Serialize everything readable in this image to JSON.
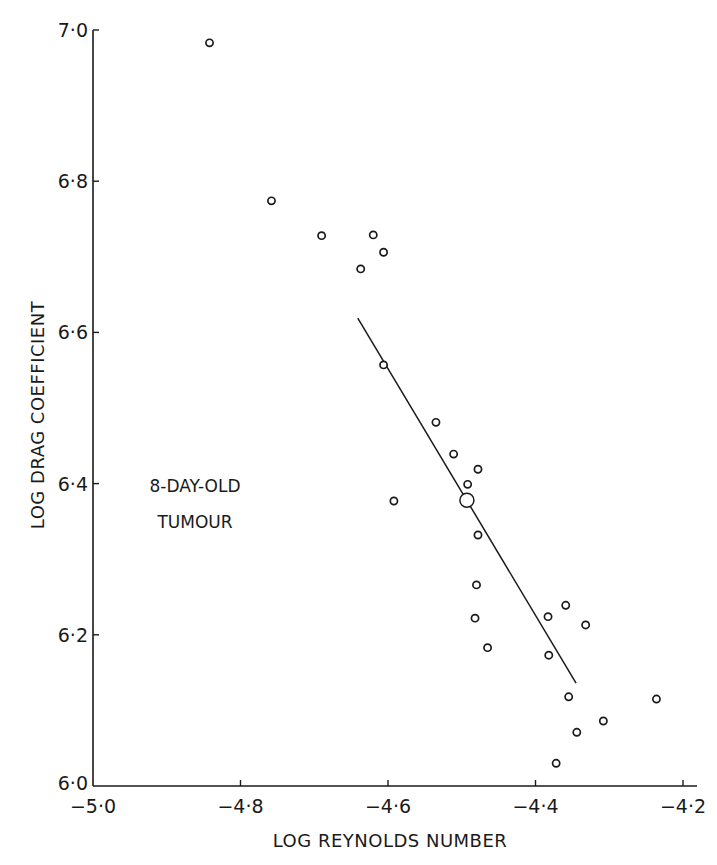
{
  "chart_data": {
    "type": "scatter",
    "title": "",
    "xlabel": "LOG REYNOLDS NUMBER",
    "ylabel": "LOG DRAG COEFFICIENT",
    "xlim": [
      -5.0,
      -4.2
    ],
    "ylim": [
      6.0,
      7.0
    ],
    "x_ticks": [
      -5.0,
      -4.8,
      -4.6,
      -4.4,
      -4.2
    ],
    "x_tick_labels": [
      "−5·0",
      "−4·8",
      "−4·6",
      "−4·4",
      "−4·2"
    ],
    "y_ticks": [
      6.0,
      6.2,
      6.4,
      6.6,
      6.8,
      7.0
    ],
    "y_tick_labels": [
      "6·0",
      "6·2",
      "6·4",
      "6·6",
      "6·8",
      "7·0"
    ],
    "grid": false,
    "legend": null,
    "annotation": [
      "8-DAY-OLD",
      "TUMOUR"
    ],
    "series": [
      {
        "name": "observations",
        "marker": "open-circle",
        "points": [
          {
            "x": -4.842,
            "y": 6.983
          },
          {
            "x": -4.758,
            "y": 6.774
          },
          {
            "x": -4.69,
            "y": 6.728
          },
          {
            "x": -4.62,
            "y": 6.729
          },
          {
            "x": -4.606,
            "y": 6.706
          },
          {
            "x": -4.637,
            "y": 6.684
          },
          {
            "x": -4.606,
            "y": 6.557
          },
          {
            "x": -4.535,
            "y": 6.481
          },
          {
            "x": -4.511,
            "y": 6.439
          },
          {
            "x": -4.478,
            "y": 6.419
          },
          {
            "x": -4.492,
            "y": 6.399
          },
          {
            "x": -4.592,
            "y": 6.377
          },
          {
            "x": -4.478,
            "y": 6.332
          },
          {
            "x": -4.48,
            "y": 6.266
          },
          {
            "x": -4.482,
            "y": 6.222
          },
          {
            "x": -4.465,
            "y": 6.183
          },
          {
            "x": -4.383,
            "y": 6.224
          },
          {
            "x": -4.359,
            "y": 6.239
          },
          {
            "x": -4.332,
            "y": 6.213
          },
          {
            "x": -4.382,
            "y": 6.173
          },
          {
            "x": -4.355,
            "y": 6.118
          },
          {
            "x": -4.236,
            "y": 6.115
          },
          {
            "x": -4.308,
            "y": 6.086
          },
          {
            "x": -4.344,
            "y": 6.071
          },
          {
            "x": -4.372,
            "y": 6.03
          }
        ]
      },
      {
        "name": "mean",
        "marker": "large-open-circle",
        "points": [
          {
            "x": -4.493,
            "y": 6.378
          }
        ]
      },
      {
        "name": "regression line",
        "type": "line",
        "points": [
          {
            "x": -4.641,
            "y": 6.619
          },
          {
            "x": -4.345,
            "y": 6.136
          }
        ]
      }
    ]
  },
  "style": {
    "ink": "#1a1a1a",
    "background": "#ffffff"
  }
}
